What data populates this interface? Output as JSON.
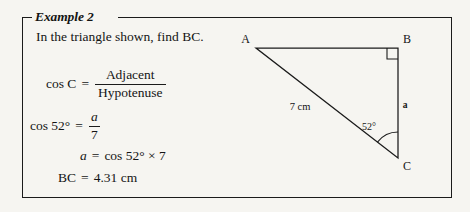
{
  "page": {
    "background_color": "#f6f5f1",
    "ink_color": "#141414"
  },
  "example_box": {
    "title": "Example 2",
    "border_color": "#1b1b1b"
  },
  "worked_example": {
    "prompt": "In the triangle shown, find BC.",
    "lines": [
      {
        "id": "cos-c-definition",
        "lhs": "cos C",
        "operator": "=",
        "numerator": "Adjacent",
        "denominator": "Hypotenuse"
      },
      {
        "id": "cos-52-equation",
        "lhs": "cos 52°",
        "operator": "=",
        "numerator": "a",
        "denominator": "7"
      },
      {
        "id": "solve-for-a",
        "lhs": "a",
        "operator": "=",
        "rhs": "cos 52° × 7"
      },
      {
        "id": "result",
        "lhs": "BC",
        "operator": "=",
        "rhs": "4.31 cm"
      }
    ]
  },
  "diagram": {
    "type": "right-triangle",
    "stroke_color": "#1b1b1b",
    "vertices": [
      {
        "name": "A",
        "label": "A",
        "x": 256,
        "y": 48,
        "label_x": 250,
        "label_y": 43
      },
      {
        "name": "B",
        "label": "B",
        "x": 398,
        "y": 48,
        "label_x": 403,
        "label_y": 43
      },
      {
        "name": "C",
        "label": "C",
        "x": 398,
        "y": 158,
        "label_x": 403,
        "label_y": 170
      }
    ],
    "side_labels": [
      {
        "name": "hypotenuse-label",
        "text": "7 cm",
        "x": 300,
        "y": 110
      },
      {
        "name": "opposite-side-label",
        "text": "a",
        "x": 405,
        "y": 108
      }
    ],
    "angle": {
      "vertex": "C",
      "text": "52°",
      "label_x": 369,
      "label_y": 130,
      "arc_radius": 26
    },
    "right_angle": {
      "vertex": "B",
      "marker_size": 11
    }
  }
}
